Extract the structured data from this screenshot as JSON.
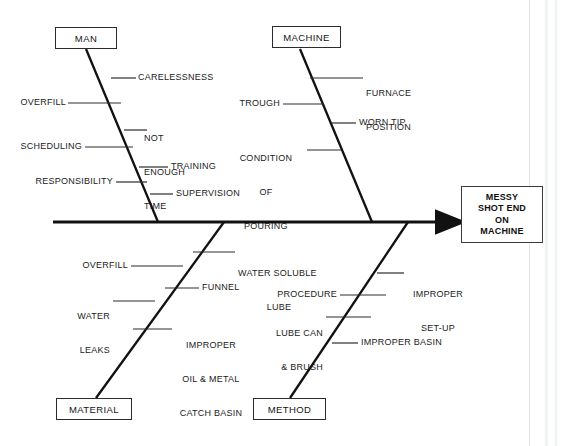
{
  "diagram": {
    "type": "fishbone-ishikawa-cause-and-effect",
    "effect": {
      "lines": [
        "MESSY",
        "SHOT END",
        "ON",
        "MACHINE"
      ],
      "text": "MESSY SHOT END ON MACHINE"
    },
    "categories": [
      {
        "id": "man",
        "label": "MAN",
        "position": "upper-left",
        "causes": [
          {
            "id": "carelessness",
            "label": "CARELESSNESS",
            "side": "right",
            "lines": [
              "CARELESSNESS"
            ]
          },
          {
            "id": "overfill-man",
            "label": "OVERFILL",
            "side": "left",
            "lines": [
              "OVERFILL"
            ]
          },
          {
            "id": "not-enough-time",
            "label": "NOT ENOUGH TIME",
            "side": "right",
            "lines": [
              "NOT",
              "ENOUGH",
              "TIME"
            ]
          },
          {
            "id": "scheduling",
            "label": "SCHEDULING",
            "side": "left",
            "lines": [
              "SCHEDULING"
            ]
          },
          {
            "id": "training",
            "label": "TRAINING",
            "side": "right",
            "lines": [
              "TRAINING"
            ]
          },
          {
            "id": "responsibility",
            "label": "RESPONSIBILITY",
            "side": "left",
            "lines": [
              "RESPONSIBILITY"
            ]
          },
          {
            "id": "supervision",
            "label": "SUPERVISION",
            "side": "right",
            "lines": [
              "SUPERVISION"
            ]
          }
        ]
      },
      {
        "id": "machine",
        "label": "MACHINE",
        "position": "upper-right",
        "causes": [
          {
            "id": "furnace-position",
            "label": "FURNACE POSITION",
            "side": "right",
            "lines": [
              "FURNACE",
              "POSITION"
            ]
          },
          {
            "id": "trough",
            "label": "TROUGH",
            "side": "left",
            "lines": [
              "TROUGH"
            ]
          },
          {
            "id": "worn-tip",
            "label": "WORN TIP",
            "side": "right",
            "lines": [
              "WORN TIP"
            ]
          },
          {
            "id": "condition-of-pouring",
            "label": "CONDITION OF POURING",
            "side": "left",
            "lines": [
              "CONDITION",
              "OF",
              "POURING"
            ]
          }
        ]
      },
      {
        "id": "material",
        "label": "MATERIAL",
        "position": "lower-left",
        "causes": [
          {
            "id": "water-soluble-lube",
            "label": "WATER SOLUBLE LUBE",
            "side": "right",
            "lines": [
              "WATER SOLUBLE",
              "LUBE"
            ]
          },
          {
            "id": "overfill-material",
            "label": "OVERFILL",
            "side": "left",
            "lines": [
              "OVERFILL"
            ]
          },
          {
            "id": "funnel",
            "label": "FUNNEL",
            "side": "right",
            "lines": [
              "FUNNEL"
            ]
          },
          {
            "id": "water-leaks",
            "label": "WATER LEAKS",
            "side": "left",
            "lines": [
              "WATER",
              "LEAKS"
            ]
          },
          {
            "id": "improper-oil-metal-catch-basin",
            "label": "IMPROPER OIL & METAL CATCH BASIN",
            "side": "right",
            "lines": [
              "IMPROPER",
              "OIL & METAL",
              "CATCH BASIN"
            ]
          }
        ]
      },
      {
        "id": "method",
        "label": "METHOD",
        "position": "lower-right",
        "causes": [
          {
            "id": "improper-set-up",
            "label": "IMPROPER SET-UP",
            "side": "right",
            "lines": [
              "IMPROPER",
              "SET-UP"
            ]
          },
          {
            "id": "procedure",
            "label": "PROCEDURE",
            "side": "left",
            "lines": [
              "PROCEDURE"
            ]
          },
          {
            "id": "lube-can-brush",
            "label": "LUBE CAN & BRUSH",
            "side": "left",
            "lines": [
              "LUBE CAN",
              "& BRUSH"
            ]
          },
          {
            "id": "improper-basin",
            "label": "IMPROPER BASIN",
            "side": "right",
            "lines": [
              "IMPROPER BASIN"
            ]
          }
        ]
      }
    ],
    "colors": {
      "background": "#ffffff",
      "line": "#1a1a1a",
      "text": "#1b1b1b",
      "box_border": "#2b2b2b"
    }
  },
  "labels": {
    "cat_man": "MAN",
    "cat_machine": "MACHINE",
    "cat_material": "MATERIAL",
    "cat_method": "METHOD",
    "effect_l1": "MESSY",
    "effect_l2": "SHOT END",
    "effect_l3": "ON",
    "effect_l4": "MACHINE",
    "carelessness": "CARELESSNESS",
    "overfill_man": "OVERFILL",
    "not_enough_time_l1": "NOT",
    "not_enough_time_l2": "ENOUGH",
    "not_enough_time_l3": "TIME",
    "scheduling": "SCHEDULING",
    "training": "TRAINING",
    "responsibility": "RESPONSIBILITY",
    "supervision": "SUPERVISION",
    "furnace_position_l1": "FURNACE",
    "furnace_position_l2": "POSITION",
    "trough": "TROUGH",
    "worn_tip": "WORN TIP",
    "condition_of_pouring_l1": "CONDITION",
    "condition_of_pouring_l2": "OF",
    "condition_of_pouring_l3": "POURING",
    "water_soluble_lube_l1": "WATER SOLUBLE",
    "water_soluble_lube_l2": "LUBE",
    "overfill_material": "OVERFILL",
    "funnel": "FUNNEL",
    "water_leaks_l1": "WATER",
    "water_leaks_l2": "LEAKS",
    "improper_oil_l1": "IMPROPER",
    "improper_oil_l2": "OIL & METAL",
    "improper_oil_l3": "CATCH BASIN",
    "improper_setup_l1": "IMPROPER",
    "improper_setup_l2": "SET-UP",
    "procedure": "PROCEDURE",
    "lube_can_l1": "LUBE CAN",
    "lube_can_l2": "& BRUSH",
    "improper_basin": "IMPROPER BASIN"
  }
}
